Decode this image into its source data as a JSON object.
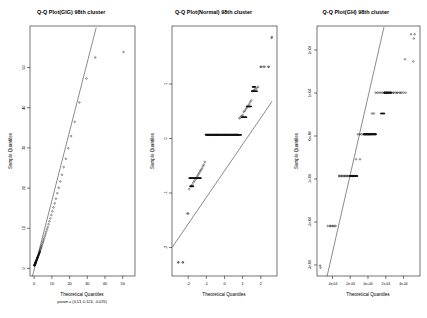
{
  "figure": {
    "background": "#ffffff",
    "point_color": "#111111",
    "line_color": "#2b2b2b",
    "axis_color": "#1a1a1a",
    "panels": 3
  },
  "panel1": {
    "title": "Q-Q Plot(GIG) 98th cluster",
    "xlabel": "Theoretical Quantiles",
    "sublabel": "param = (0.13, 0.124, -0.025)",
    "ylabel": "Sample Quantiles",
    "xticks": [
      "0",
      "10",
      "20",
      "30",
      "40",
      "50"
    ],
    "yticks": [
      "0",
      "10",
      "20",
      "30",
      "40",
      "50"
    ]
  },
  "panel2": {
    "title": "Q-Q Plot(Normal) 98th cluster",
    "xlabel": "Theoretical Quantiles",
    "ylabel": "Sample Quantiles",
    "xticks": [
      "-2",
      "-1",
      "0",
      "1",
      "2"
    ],
    "yticks": [
      "-2",
      "-1",
      "0",
      "1"
    ]
  },
  "panel3": {
    "title": "Q-Q Plot(GH) 98th cluster",
    "xlabel": "Theoretical Quantiles",
    "ylabel": "Sample Quantiles",
    "xticks": [
      "-4e-04",
      "-2e-04",
      "0e+00",
      "2e-04",
      "4e-04"
    ],
    "yticks": [
      "-3e-04",
      "-2e-04",
      "-1e-04",
      "0e+00",
      "1e-04",
      "2e-04"
    ]
  },
  "chart_data": [
    {
      "type": "scatter",
      "title": "Q-Q Plot(GIG) 98th cluster",
      "xlabel": "Theoretical Quantiles",
      "sublabel": "param = (0.13, 0.124, -0.025)",
      "ylabel": "Sample Quantiles",
      "xlim": [
        -2.5,
        57
      ],
      "ylim": [
        -2.5,
        57
      ],
      "xticks": [
        0,
        10,
        20,
        30,
        40,
        50
      ],
      "yticks": [
        0,
        10,
        20,
        30,
        40,
        50
      ],
      "grid": false,
      "legend": null,
      "reference_line": {
        "type": "qq-line",
        "x": [
          -1.0,
          35.0
        ],
        "y": [
          -1.0,
          54.0
        ]
      },
      "x": [
        0.05,
        0.1,
        0.15,
        0.2,
        0.25,
        0.3,
        0.35,
        0.4,
        0.45,
        0.5,
        0.55,
        0.6,
        0.65,
        0.7,
        0.75,
        0.8,
        0.9,
        1.0,
        1.1,
        1.2,
        1.3,
        1.4,
        1.5,
        1.6,
        1.7,
        1.8,
        1.9,
        2.0,
        2.2,
        2.4,
        2.6,
        2.8,
        3.0,
        3.2,
        3.4,
        3.6,
        3.8,
        4.0,
        4.3,
        4.6,
        4.9,
        5.2,
        5.5,
        5.9,
        6.3,
        6.7,
        7.1,
        7.5,
        8.0,
        8.5,
        9.0,
        9.6,
        10.2,
        10.8,
        11.5,
        12.2,
        13.0,
        13.8,
        14.7,
        15.6,
        16.6,
        17.8,
        19.2,
        20.8,
        22.8,
        25.5,
        29.5,
        34.5,
        50.5
      ],
      "y": [
        0.02,
        0.06,
        0.1,
        0.14,
        0.2,
        0.26,
        0.32,
        0.38,
        0.43,
        0.48,
        0.54,
        0.6,
        0.66,
        0.72,
        0.78,
        0.84,
        0.95,
        1.05,
        1.16,
        1.27,
        1.38,
        1.49,
        1.6,
        1.72,
        1.83,
        1.94,
        2.06,
        2.18,
        2.4,
        2.63,
        2.86,
        3.1,
        3.34,
        3.58,
        3.82,
        4.06,
        4.3,
        4.55,
        4.92,
        5.3,
        5.68,
        6.07,
        6.46,
        6.98,
        7.5,
        8.04,
        8.58,
        9.12,
        9.8,
        10.5,
        11.2,
        12.0,
        12.9,
        13.8,
        14.8,
        15.9,
        17.2,
        18.5,
        20.0,
        21.6,
        23.4,
        25.4,
        27.9,
        30.8,
        34.2,
        38.8,
        44.5,
        49.5,
        50.8
      ]
    },
    {
      "type": "scatter",
      "title": "Q-Q Plot(Normal) 98th cluster",
      "xlabel": "Theoretical Quantiles",
      "ylabel": "Sample Quantiles",
      "xlim": [
        -2.9,
        2.9
      ],
      "ylim": [
        -2.6,
        2.0
      ],
      "xticks": [
        -2,
        -1,
        0,
        1,
        2
      ],
      "yticks": [
        -2,
        -1,
        0,
        1
      ],
      "grid": false,
      "legend": null,
      "reference_line": {
        "type": "qq-line",
        "x": [
          -2.9,
          2.6
        ],
        "y": [
          -2.0,
          1.25
        ]
      },
      "notes": "discrete/ties data: long horizontal band of tied values at y=0, step groups, outliers at top-right and bottom-left",
      "x": [
        -2.55,
        -2.3,
        -2.05,
        -1.95,
        -1.85,
        -1.78,
        -1.72,
        -1.66,
        -1.6,
        -1.54,
        -1.49,
        -1.44,
        -1.39,
        -1.34,
        -1.29,
        -1.24,
        -1.19,
        -1.14,
        -1.09,
        -1.04,
        -0.99,
        -0.94,
        -0.89,
        -0.84,
        -0.79,
        -0.74,
        -0.69,
        -0.64,
        -0.59,
        -0.54,
        -0.49,
        -0.44,
        -0.39,
        -0.34,
        -0.29,
        -0.24,
        -0.19,
        -0.14,
        -0.09,
        -0.04,
        0.01,
        0.06,
        0.11,
        0.16,
        0.21,
        0.26,
        0.31,
        0.36,
        0.41,
        0.46,
        0.51,
        0.56,
        0.61,
        0.66,
        0.71,
        0.76,
        0.82,
        0.88,
        0.94,
        1.0,
        1.06,
        1.12,
        1.18,
        1.24,
        1.3,
        1.36,
        1.42,
        1.48,
        1.55,
        1.62,
        1.7,
        1.78,
        1.86,
        2.0,
        2.15,
        2.45,
        2.6
      ],
      "y": [
        -2.35,
        -2.35,
        -1.45,
        -1.0,
        -0.95,
        -0.92,
        -0.88,
        -0.85,
        -0.82,
        -0.79,
        -0.76,
        -0.73,
        -0.7,
        -0.67,
        -0.65,
        -0.62,
        -0.58,
        -0.55,
        -0.5,
        0.0,
        0.0,
        0.0,
        0.0,
        0.0,
        0.0,
        0.0,
        0.0,
        0.0,
        0.0,
        0.0,
        0.0,
        0.0,
        0.0,
        0.0,
        0.0,
        0.0,
        0.0,
        0.0,
        0.0,
        0.0,
        0.0,
        0.0,
        0.0,
        0.0,
        0.0,
        0.0,
        0.0,
        0.0,
        0.0,
        0.0,
        0.0,
        0.0,
        0.0,
        0.0,
        0.0,
        0.0,
        0.3,
        0.32,
        0.34,
        0.36,
        0.42,
        0.44,
        0.47,
        0.5,
        0.53,
        0.56,
        0.6,
        0.63,
        0.8,
        0.82,
        0.84,
        0.86,
        0.88,
        1.25,
        1.25,
        1.25,
        1.78
      ]
    },
    {
      "type": "scatter",
      "title": "Q-Q Plot(GH) 98th cluster",
      "xlabel": "Theoretical Quantiles",
      "ylabel": "Sample Quantiles",
      "xlim": [
        -0.00058,
        0.00058
      ],
      "ylim": [
        -0.00034,
        0.00026
      ],
      "xticks": [
        -0.0004,
        -0.0002,
        0,
        0.0002,
        0.0004
      ],
      "yticks": [
        -0.0003,
        -0.0002,
        -0.0001,
        0,
        0.0001,
        0.0002
      ],
      "grid": false,
      "legend": null,
      "reference_line": {
        "type": "qq-line",
        "x": [
          -0.00046,
          0.00018
        ],
        "y": [
          -0.00033,
          0.00027
        ]
      },
      "notes": "discrete banded data; steep reference line; outliers far right and bottom-left",
      "x": [
        -0.00054,
        -0.00043,
        -0.0004,
        -0.00037,
        -0.00033,
        -0.0003,
        -0.00027,
        -0.00024,
        -0.00021,
        -0.00018,
        -0.00016,
        -0.00014,
        -0.00012,
        -0.0001,
        -8e-05,
        -6e-05,
        -4e-05,
        -2e-05,
        0.0,
        2e-05,
        4e-05,
        6e-05,
        8e-05,
        0.0001,
        0.00012,
        0.00014,
        0.00016,
        0.00018,
        0.0002,
        0.00022,
        0.00025,
        0.00028,
        0.00032,
        0.00036,
        0.00041,
        0.00048,
        0.00052
      ],
      "y": [
        -0.00032,
        -0.00022,
        -0.00022,
        -0.00022,
        -0.0001,
        -0.0001,
        -0.0001,
        -0.0001,
        -0.0001,
        -0.0001,
        -0.0001,
        -6e-05,
        0.0,
        0.0,
        0.0,
        0.0,
        0.0,
        0.0,
        0.0,
        0.0,
        5e-05,
        5e-05,
        0.0001,
        0.0001,
        0.0001,
        0.0001,
        0.0001,
        0.0001,
        0.0001,
        0.0001,
        0.0001,
        0.0001,
        0.0001,
        0.0001,
        0.00018,
        0.00024,
        0.00024
      ]
    }
  ]
}
